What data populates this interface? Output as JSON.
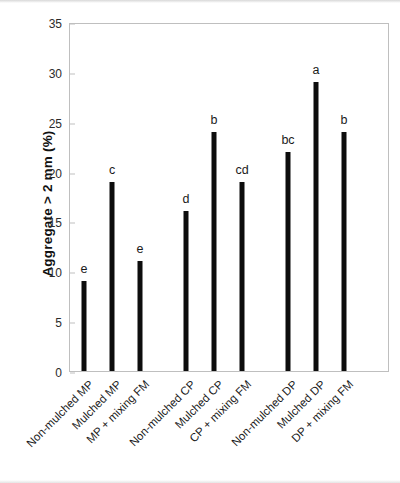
{
  "chart_data": {
    "type": "bar",
    "title": "",
    "xlabel": "",
    "ylabel": "Aggregate > 2 mm (%)",
    "ylim": [
      0,
      35
    ],
    "yticks": [
      0,
      5,
      10,
      15,
      20,
      25,
      30,
      35
    ],
    "grid": false,
    "legend": "none",
    "bar_color": "#0d0d0d",
    "plot_border_color": "#bfbfbf",
    "categories": [
      "Non-mulched MP",
      "Mulched MP",
      "MP + mixing FM",
      "Non-mulched CP",
      "Mulched CP",
      "CP + mixing FM",
      "Non-mulched DP",
      "Mulched DP",
      "DP + mixing FM"
    ],
    "values": [
      9,
      19,
      11,
      16,
      24,
      19,
      22,
      29,
      24
    ],
    "annotations": [
      "e",
      "c",
      "e",
      "d",
      "b",
      "cd",
      "bc",
      "a",
      "b"
    ],
    "group_breaks": [
      3,
      6
    ]
  }
}
